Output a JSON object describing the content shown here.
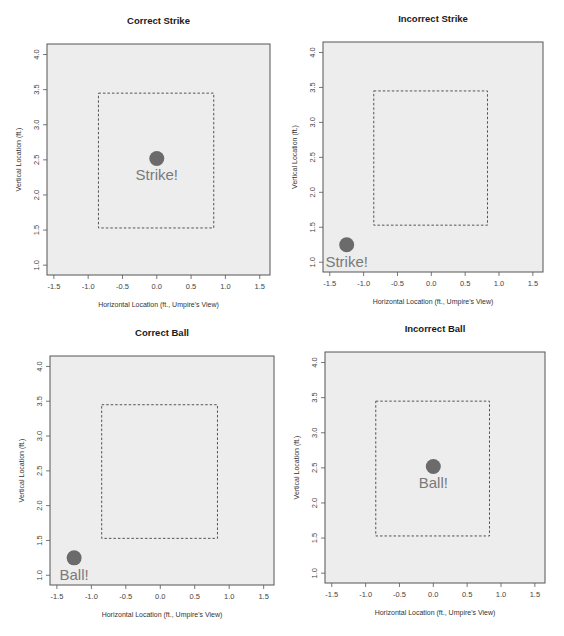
{
  "figure": {
    "panel_titles": [
      "Correct Strike",
      "Incorrect Strike",
      "Correct Ball",
      "Incorrect Ball"
    ],
    "xlabel": "Horizontal Location (ft., Umpire's View)",
    "ylabel": "Vertical Location (ft.)"
  },
  "colors": {
    "plot_background": "#ededed",
    "frame": "#555555",
    "strike_zone": "#444444",
    "pitch_point": "#6b6b6b",
    "call_label": "#7a7a7a"
  },
  "chart_data": [
    {
      "type": "scatter",
      "title": "Correct Strike",
      "xlabel": "Horizontal Location (ft., Umpire's View)",
      "ylabel": "Vertical Location (ft.)",
      "xlim": [
        -1.6,
        1.65
      ],
      "ylim": [
        0.86,
        4.15
      ],
      "xticks": [
        -1.5,
        -1.0,
        -0.5,
        0.0,
        0.5,
        1.0,
        1.5
      ],
      "yticks": [
        1.0,
        1.5,
        2.0,
        2.5,
        3.0,
        3.5,
        4.0
      ],
      "grid": false,
      "strike_zone": {
        "x": [
          -0.85,
          0.83
        ],
        "y": [
          1.53,
          3.45
        ],
        "style": "dashed"
      },
      "points": [
        {
          "x": 0.0,
          "y": 2.52,
          "label": "Strike!"
        }
      ],
      "frame_px": {
        "left": 47,
        "top": 44,
        "right": 270,
        "bottom": 275
      }
    },
    {
      "type": "scatter",
      "title": "Incorrect Strike",
      "xlabel": "Horizontal Location (ft., Umpire's View)",
      "ylabel": "Vertical Location (ft.)",
      "xlim": [
        -1.6,
        1.65
      ],
      "ylim": [
        0.86,
        4.15
      ],
      "xticks": [
        -1.5,
        -1.0,
        -0.5,
        0.0,
        0.5,
        1.0,
        1.5
      ],
      "yticks": [
        1.0,
        1.5,
        2.0,
        2.5,
        3.0,
        3.5,
        4.0
      ],
      "grid": false,
      "strike_zone": {
        "x": [
          -0.85,
          0.83
        ],
        "y": [
          1.53,
          3.45
        ],
        "style": "dashed"
      },
      "points": [
        {
          "x": -1.25,
          "y": 1.25,
          "label": "Strike!"
        }
      ],
      "frame_px": {
        "left": 323,
        "top": 42,
        "right": 543,
        "bottom": 272
      }
    },
    {
      "type": "scatter",
      "title": "Correct Ball",
      "xlabel": "Horizontal Location (ft., Umpire's View)",
      "ylabel": "Vertical Location (ft.)",
      "xlim": [
        -1.6,
        1.65
      ],
      "ylim": [
        0.86,
        4.15
      ],
      "xticks": [
        -1.5,
        -1.0,
        -0.5,
        0.0,
        0.5,
        1.0,
        1.5
      ],
      "yticks": [
        1.0,
        1.5,
        2.0,
        2.5,
        3.0,
        3.5,
        4.0
      ],
      "grid": false,
      "strike_zone": {
        "x": [
          -0.85,
          0.83
        ],
        "y": [
          1.53,
          3.45
        ],
        "style": "dashed"
      },
      "points": [
        {
          "x": -1.25,
          "y": 1.25,
          "label": "Ball!"
        }
      ],
      "frame_px": {
        "left": 50,
        "top": 356,
        "right": 274,
        "bottom": 585
      }
    },
    {
      "type": "scatter",
      "title": "Incorrect Ball",
      "xlabel": "Horizontal Location (ft., Umpire's View)",
      "ylabel": "Vertical Location (ft.)",
      "xlim": [
        -1.6,
        1.65
      ],
      "ylim": [
        0.86,
        4.15
      ],
      "xticks": [
        -1.5,
        -1.0,
        -0.5,
        0.0,
        0.5,
        1.0,
        1.5
      ],
      "yticks": [
        1.0,
        1.5,
        2.0,
        2.5,
        3.0,
        3.5,
        4.0
      ],
      "grid": false,
      "strike_zone": {
        "x": [
          -0.85,
          0.83
        ],
        "y": [
          1.53,
          3.45
        ],
        "style": "dashed"
      },
      "points": [
        {
          "x": 0.0,
          "y": 2.52,
          "label": "Ball!"
        }
      ],
      "frame_px": {
        "left": 325,
        "top": 352,
        "right": 545,
        "bottom": 583
      }
    }
  ]
}
